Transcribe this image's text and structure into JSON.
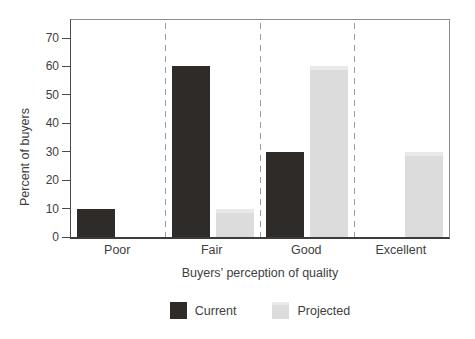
{
  "chart_data": {
    "type": "bar",
    "title": "",
    "xlabel": "Buyers’ perception of quality",
    "ylabel": "Percent of buyers",
    "categories": [
      "Poor",
      "Fair",
      "Good",
      "Excellent"
    ],
    "series": [
      {
        "name": "Current",
        "color": "#2e2b29",
        "values": [
          10,
          60,
          30,
          0
        ]
      },
      {
        "name": "Projected",
        "color": "#dcdcdc",
        "values": [
          0,
          10,
          60,
          30
        ]
      }
    ],
    "ylim": [
      0,
      70
    ],
    "yticks": [
      0,
      10,
      20,
      30,
      40,
      50,
      60,
      70
    ],
    "grid": "vertical-dashed-category-separators",
    "legend_position": "bottom-center"
  },
  "style": {
    "background": "#ffffff",
    "current_color": "#2e2b29",
    "projected_color": "#dcdcdc",
    "separator_color": "#9d9d9d",
    "axis_color": "#4a4a4a",
    "frame_color": "#8c8c8c",
    "text_color": "#3e3e3e"
  }
}
